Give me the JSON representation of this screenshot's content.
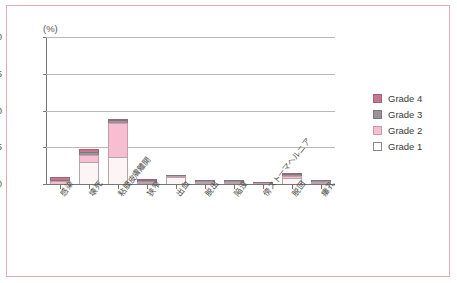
{
  "chart_data": {
    "type": "bar",
    "stacked": true,
    "title": "",
    "xlabel": "",
    "ylabel": "(%)",
    "unit_label": "(%)",
    "ylim": [
      0,
      20
    ],
    "yticks": [
      0,
      5,
      10,
      15,
      20
    ],
    "grid": true,
    "legend_position": "right",
    "categories": [
      "感染",
      "壊死",
      "粘膜皮膚離開",
      "狭窄",
      "出血",
      "脱出",
      "陥没",
      "傍ストーマヘルニア",
      "脱回",
      "瘻孔"
    ],
    "series": [
      {
        "name": "Grade 1",
        "color": "#ffffff",
        "values": [
          0.0,
          3.0,
          3.7,
          0.1,
          0.9,
          0.05,
          0.1,
          0.0,
          0.8,
          0.05
        ]
      },
      {
        "name": "Grade 2",
        "color": "#f7bdd0",
        "values": [
          0.35,
          0.9,
          4.6,
          0.1,
          0.05,
          0.05,
          0.1,
          0.05,
          0.35,
          0.05
        ]
      },
      {
        "name": "Grade 3",
        "color": "#9a9399",
        "values": [
          0.15,
          0.5,
          0.4,
          0.2,
          0.05,
          0.2,
          0.2,
          0.1,
          0.1,
          0.2
        ]
      },
      {
        "name": "Grade 4",
        "color": "#c4788f",
        "values": [
          0.4,
          0.3,
          0.1,
          0.05,
          0.0,
          0.0,
          0.0,
          0.0,
          0.1,
          0.0
        ]
      }
    ],
    "totals": [
      0.9,
      4.7,
      8.8,
      0.45,
      1.0,
      0.3,
      0.4,
      0.15,
      1.35,
      0.3
    ]
  },
  "legend": {
    "items": [
      {
        "label": "Grade 4",
        "swatch": "g4"
      },
      {
        "label": "Grade 3",
        "swatch": "g3"
      },
      {
        "label": "Grade 2",
        "swatch": "g2"
      },
      {
        "label": "Grade 1",
        "swatch": "g1"
      }
    ]
  },
  "frame": {
    "border_color": "#e8aab8",
    "background": "#ffffff"
  }
}
